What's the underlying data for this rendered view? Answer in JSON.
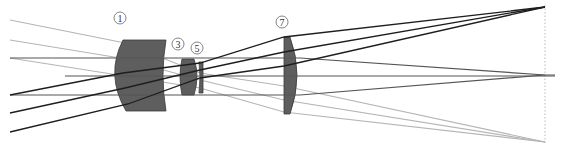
{
  "diagram": {
    "type": "optical-lens-ray-trace",
    "colors": {
      "lens_fill": "#5e5e5e",
      "lens_stroke": "#3a3a3a",
      "ray_black": "#1e1e1e",
      "ray_dark": "#555555",
      "ray_light": "#b5b5b5",
      "image_plane": "#bbbbbb",
      "label_stroke": "#666666"
    },
    "labels": [
      {
        "id": "lens-1",
        "text": "1",
        "cx": 120,
        "cy": 18
      },
      {
        "id": "lens-3",
        "text": "3",
        "cx": 178,
        "cy": 44
      },
      {
        "id": "lens-5",
        "text": "5",
        "cx": 197,
        "cy": 48
      },
      {
        "id": "lens-7",
        "text": "7",
        "cx": 282,
        "cy": 22
      }
    ],
    "lenses": [
      {
        "id": "lens-1",
        "path": "M123,40 L166,40 Q160,75 166,111 L126,111 Q105,75 123,40 Z"
      },
      {
        "id": "lens-3",
        "path": "M182,59 L194,59 Q200,76 194,95 L182,95 Q178,76 182,59 Z"
      },
      {
        "id": "lens-5",
        "path": "M199,62 L203,62 L203,93 L199,93 Q201,77 199,62 Z"
      },
      {
        "id": "lens-7",
        "path": "M284,37 L290,37 Q304,75 290,114 L284,114 Z"
      }
    ],
    "rays": {
      "black": [
        [
          [
            10,
            95
          ],
          [
            123,
            73
          ],
          [
            200,
            63
          ],
          [
            284,
            37
          ],
          [
            545,
            7
          ]
        ],
        [
          [
            10,
            113
          ],
          [
            125,
            88
          ],
          [
            200,
            70
          ],
          [
            284,
            52
          ],
          [
            545,
            7
          ]
        ],
        [
          [
            10,
            132
          ],
          [
            128,
            104
          ],
          [
            200,
            78
          ],
          [
            284,
            66
          ],
          [
            545,
            7
          ]
        ]
      ],
      "dark": [
        [
          [
            10,
            58
          ],
          [
            300,
            58
          ],
          [
            545,
            75
          ],
          [
            555,
            75
          ]
        ],
        [
          [
            65,
            76
          ],
          [
            555,
            76
          ]
        ],
        [
          [
            10,
            95
          ],
          [
            300,
            95
          ],
          [
            545,
            75
          ]
        ]
      ],
      "light": [
        [
          [
            10,
            20
          ],
          [
            125,
            43
          ],
          [
            200,
            73
          ],
          [
            284,
            86
          ],
          [
            545,
            142
          ]
        ],
        [
          [
            10,
            40
          ],
          [
            120,
            58
          ],
          [
            200,
            80
          ],
          [
            284,
            100
          ],
          [
            545,
            142
          ]
        ],
        [
          [
            10,
            58
          ],
          [
            118,
            75
          ],
          [
            200,
            88
          ],
          [
            284,
            112
          ],
          [
            545,
            142
          ]
        ]
      ]
    },
    "image_plane": {
      "x": 545,
      "y1": 5,
      "y2": 145
    }
  }
}
